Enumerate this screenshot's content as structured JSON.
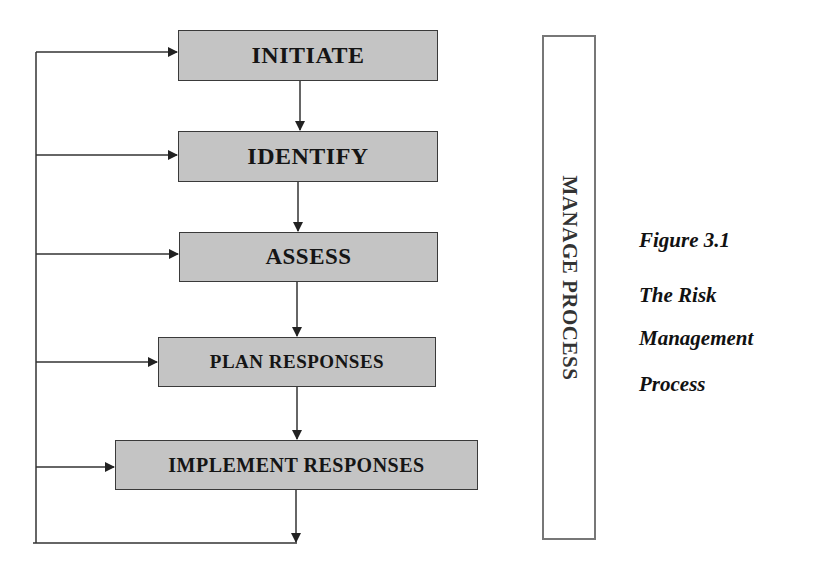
{
  "diagram": {
    "steps": [
      {
        "label": "INITIATE"
      },
      {
        "label": "IDENTIFY"
      },
      {
        "label": "ASSESS"
      },
      {
        "label": "PLAN RESPONSES"
      },
      {
        "label": "IMPLEMENT RESPONSES"
      }
    ],
    "manage_label": "MANAGE PROCESS"
  },
  "caption": {
    "figure": "Figure 3.1",
    "line1": "The Risk",
    "line2": "Management",
    "line3": "Process"
  },
  "colors": {
    "box_fill": "#c4c4c4",
    "box_border": "#3a3a3a",
    "line": "#333333"
  }
}
